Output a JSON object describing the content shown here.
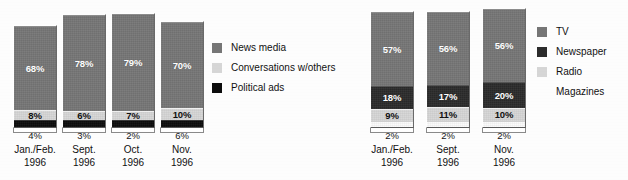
{
  "chart_data": [
    {
      "type": "bar",
      "title": "",
      "subtype": "stacked-bar",
      "id": "campaign-information-sources",
      "position": "left",
      "xlabel": "",
      "ylabel": "",
      "categories": [
        "Jan./Feb.\n1996",
        "Sept.\n1996",
        "Oct.\n1996",
        "Nov.\n1996"
      ],
      "category_lines": [
        [
          "Jan./Feb.",
          "1996"
        ],
        [
          "Sept.",
          "1996"
        ],
        [
          "Oct.",
          "1996"
        ],
        [
          "Nov.",
          "1996"
        ]
      ],
      "legend_position": "right",
      "grid": false,
      "series": [
        {
          "name": "News media",
          "color": "#767676",
          "values": [
            68,
            78,
            79,
            70
          ],
          "labels": [
            "68%",
            "78%",
            "79%",
            "70%"
          ]
        },
        {
          "name": "Conversations w/others",
          "color": "#d6d6d6",
          "values": [
            8,
            6,
            7,
            10
          ],
          "labels": [
            "8%",
            "6%",
            "7%",
            "10%"
          ]
        },
        {
          "name": "Political ads",
          "color": "#0c0c0c",
          "values": [
            4,
            3,
            2,
            6
          ],
          "labels": [
            "4%",
            "3%",
            "2%",
            "6%"
          ]
        }
      ],
      "outside_labels": [
        "4%",
        "3%",
        "2%",
        "6%"
      ]
    },
    {
      "type": "bar",
      "title": "",
      "subtype": "stacked-bar",
      "id": "media-type-sources",
      "position": "right",
      "xlabel": "",
      "ylabel": "",
      "categories": [
        "Jan./Feb.\n1996",
        "Sept.\n1996",
        "Nov.\n1996"
      ],
      "category_lines": [
        [
          "Jan./Feb.",
          "1996"
        ],
        [
          "Sept.",
          "1996"
        ],
        [
          "Nov.",
          "1996"
        ]
      ],
      "legend_position": "right",
      "grid": false,
      "series": [
        {
          "name": "TV",
          "color": "#767676",
          "values": [
            57,
            56,
            56
          ],
          "labels": [
            "57%",
            "56%",
            "56%"
          ]
        },
        {
          "name": "Newspaper",
          "color": "#2b2b2b",
          "values": [
            18,
            17,
            20
          ],
          "labels": [
            "18%",
            "17%",
            "20%"
          ]
        },
        {
          "name": "Radio",
          "color": "#d6d6d6",
          "values": [
            9,
            11,
            10
          ],
          "labels": [
            "9%",
            "11%",
            "10%"
          ]
        },
        {
          "name": "Magazines",
          "color": "#fbfbfb",
          "values": [
            2,
            2,
            2
          ],
          "labels": [
            "2%",
            "2%",
            "2%"
          ]
        }
      ],
      "outside_labels": [
        "2%",
        "2%",
        "2%"
      ]
    }
  ],
  "left_chart": {
    "bars": [
      {
        "segments": [
          {
            "label": "68%",
            "series": "News media"
          },
          {
            "label": "8%",
            "series": "Conversations w/others"
          },
          {
            "label": "",
            "series": "Political ads"
          }
        ],
        "under_value": "4%",
        "cat_line1": "Jan./Feb.",
        "cat_line2": "1996"
      },
      {
        "segments": [
          {
            "label": "78%",
            "series": "News media"
          },
          {
            "label": "6%",
            "series": "Conversations w/others"
          },
          {
            "label": "",
            "series": "Political ads"
          }
        ],
        "under_value": "3%",
        "cat_line1": "Sept.",
        "cat_line2": "1996"
      },
      {
        "segments": [
          {
            "label": "79%",
            "series": "News media"
          },
          {
            "label": "7%",
            "series": "Conversations w/others"
          },
          {
            "label": "",
            "series": "Political ads"
          }
        ],
        "under_value": "2%",
        "cat_line1": "Oct.",
        "cat_line2": "1996"
      },
      {
        "segments": [
          {
            "label": "70%",
            "series": "News media"
          },
          {
            "label": "10%",
            "series": "Conversations w/others"
          },
          {
            "label": "",
            "series": "Political ads"
          }
        ],
        "under_value": "6%",
        "cat_line1": "Nov.",
        "cat_line2": "1996"
      }
    ],
    "legend": [
      {
        "label": "News media",
        "swatch": "dark"
      },
      {
        "label": "Conversations w/others",
        "swatch": "light"
      },
      {
        "label": "Political ads",
        "swatch": "black"
      }
    ]
  },
  "right_chart": {
    "bars": [
      {
        "segments": [
          {
            "label": "57%",
            "series": "TV"
          },
          {
            "label": "18%",
            "series": "Newspaper"
          },
          {
            "label": "9%",
            "series": "Radio"
          },
          {
            "label": "",
            "series": "Magazines"
          }
        ],
        "under_value": "2%",
        "cat_line1": "Jan./Feb.",
        "cat_line2": "1996"
      },
      {
        "segments": [
          {
            "label": "56%",
            "series": "TV"
          },
          {
            "label": "17%",
            "series": "Newspaper"
          },
          {
            "label": "11%",
            "series": "Radio"
          },
          {
            "label": "",
            "series": "Magazines"
          }
        ],
        "under_value": "2%",
        "cat_line1": "Sept.",
        "cat_line2": "1996"
      },
      {
        "segments": [
          {
            "label": "56%",
            "series": "TV"
          },
          {
            "label": "20%",
            "series": "Newspaper"
          },
          {
            "label": "10%",
            "series": "Radio"
          },
          {
            "label": "",
            "series": "Magazines"
          }
        ],
        "under_value": "2%",
        "cat_line1": "Nov.",
        "cat_line2": "1996"
      }
    ],
    "legend": [
      {
        "label": "TV",
        "swatch": "dark"
      },
      {
        "label": "Newspaper",
        "swatch": "mid"
      },
      {
        "label": "Radio",
        "swatch": "light"
      },
      {
        "label": "Magazines",
        "swatch": "none"
      }
    ]
  }
}
